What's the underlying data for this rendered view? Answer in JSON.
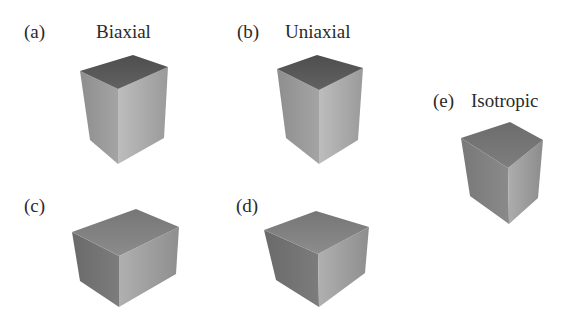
{
  "figure": {
    "panels": [
      {
        "id": "a",
        "tag": "(a)",
        "title": "Biaxial"
      },
      {
        "id": "b",
        "tag": "(b)",
        "title": "Uniaxial"
      },
      {
        "id": "c",
        "tag": "(c)",
        "title": ""
      },
      {
        "id": "d",
        "tag": "(d)",
        "title": ""
      },
      {
        "id": "e",
        "tag": "(e)",
        "title": "Isotropic"
      }
    ]
  },
  "colors": {
    "background": "#ffffff",
    "text": "#2a2a2a",
    "top_face_dark": "#555555",
    "top_face_light": "#808080",
    "side_face_mid": "#999999",
    "side_face_light": "#b4b4b4",
    "side_face_dark": "#6c6c6c"
  }
}
